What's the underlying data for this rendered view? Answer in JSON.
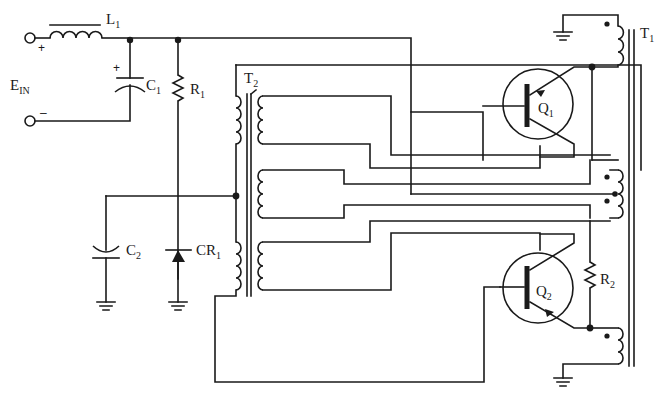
{
  "diagram": {
    "type": "circuit-schematic",
    "colors": {
      "ink": "#1a1a1a",
      "background": "#ffffff"
    }
  },
  "labels": {
    "input": {
      "main": "E",
      "sub": "IN",
      "plus": "+",
      "minus": "–"
    },
    "L1": {
      "main": "L",
      "sub": "1"
    },
    "C1": {
      "main": "C",
      "sub": "1",
      "polarity": "+"
    },
    "R1": {
      "main": "R",
      "sub": "1"
    },
    "T2": {
      "main": "T",
      "sub": "2"
    },
    "T1": {
      "main": "T",
      "sub": "1"
    },
    "Q1": {
      "main": "Q",
      "sub": "1"
    },
    "Q2": {
      "main": "Q",
      "sub": "2"
    },
    "R2": {
      "main": "R",
      "sub": "2"
    },
    "C2": {
      "main": "C",
      "sub": "2"
    },
    "CR1": {
      "main": "CR",
      "sub": "1"
    }
  },
  "components": [
    {
      "ref": "L1",
      "kind": "inductor"
    },
    {
      "ref": "C1",
      "kind": "polarized-capacitor"
    },
    {
      "ref": "R1",
      "kind": "resistor"
    },
    {
      "ref": "C2",
      "kind": "capacitor"
    },
    {
      "ref": "CR1",
      "kind": "diode"
    },
    {
      "ref": "T2",
      "kind": "transformer",
      "windings": 4
    },
    {
      "ref": "T1",
      "kind": "transformer",
      "windings": 4
    },
    {
      "ref": "Q1",
      "kind": "npn-transistor"
    },
    {
      "ref": "Q2",
      "kind": "npn-transistor"
    },
    {
      "ref": "R2",
      "kind": "resistor"
    }
  ]
}
